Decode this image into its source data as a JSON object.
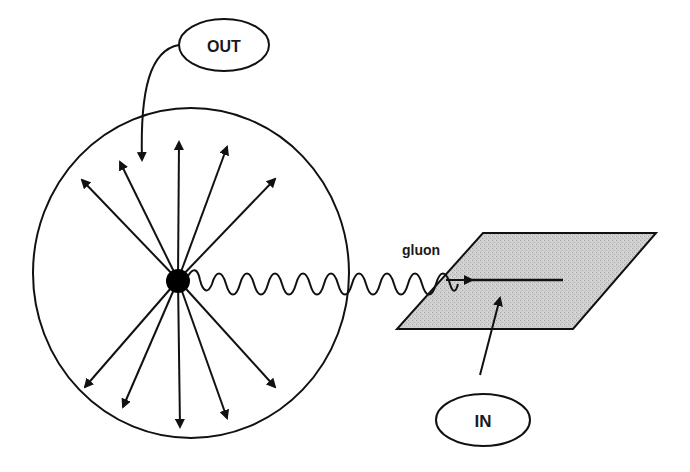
{
  "diagram": {
    "labels": {
      "out": "OUT",
      "in": "IN",
      "gluon": "gluon"
    },
    "colors": {
      "stroke": "#111111",
      "plane_fill": "#c9c9c9",
      "background": "#ffffff"
    },
    "elements": {
      "sphere": "outgoing radiation sphere",
      "source_dot": "emission point",
      "radial_arrows_count": 10,
      "plane": "incoming plane",
      "gluon_wave": "wavy gluon line"
    }
  }
}
